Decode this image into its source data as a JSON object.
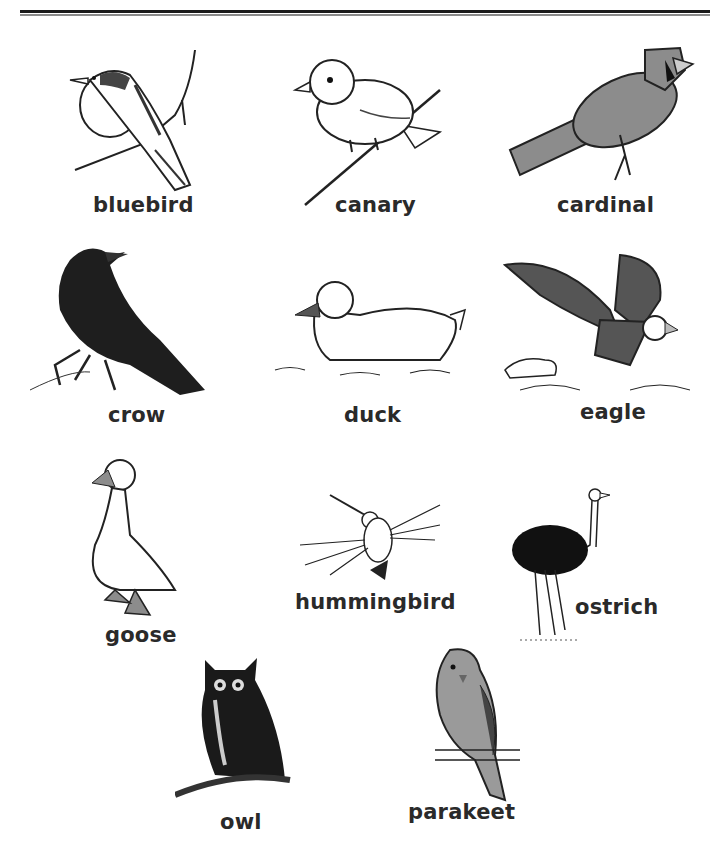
{
  "page": {
    "title_rule": "double horizontal rule",
    "colors": {
      "ink": "#1a1a1a",
      "gray_fill": "#8c8c8c",
      "dark_fill": "#2b2b2b",
      "paper": "#ffffff"
    }
  },
  "birds": [
    {
      "id": "bluebird",
      "label": "bluebird",
      "icon": "bluebird-illustration"
    },
    {
      "id": "canary",
      "label": "canary",
      "icon": "canary-illustration"
    },
    {
      "id": "cardinal",
      "label": "cardinal",
      "icon": "cardinal-illustration"
    },
    {
      "id": "crow",
      "label": "crow",
      "icon": "crow-illustration"
    },
    {
      "id": "duck",
      "label": "duck",
      "icon": "duck-illustration"
    },
    {
      "id": "eagle",
      "label": "eagle",
      "icon": "eagle-illustration"
    },
    {
      "id": "goose",
      "label": "goose",
      "icon": "goose-illustration"
    },
    {
      "id": "hummingbird",
      "label": "hummingbird",
      "icon": "hummingbird-illustration"
    },
    {
      "id": "ostrich",
      "label": "ostrich",
      "icon": "ostrich-illustration"
    },
    {
      "id": "owl",
      "label": "owl",
      "icon": "owl-illustration"
    },
    {
      "id": "parakeet",
      "label": "parakeet",
      "icon": "parakeet-illustration"
    }
  ]
}
